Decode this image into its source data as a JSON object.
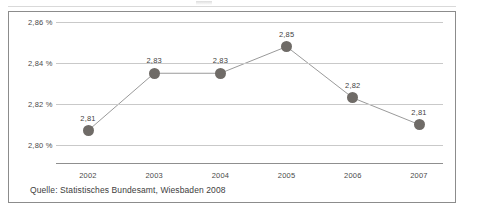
{
  "chart_data": {
    "type": "line",
    "title": "",
    "xlabel": "",
    "ylabel": "",
    "categories": [
      "2002",
      "2003",
      "2004",
      "2005",
      "2006",
      "2007"
    ],
    "values": [
      2.81,
      2.83,
      2.83,
      2.85,
      2.82,
      2.81
    ],
    "plotted_values": [
      2.807,
      2.835,
      2.835,
      2.848,
      2.823,
      2.81
    ],
    "point_labels": [
      "2,81",
      "2,83",
      "2,83",
      "2,85",
      "2,82",
      "2,81"
    ],
    "ylim": [
      2.795,
      2.862
    ],
    "yticks": [
      2.86,
      2.84,
      2.82,
      2.8
    ],
    "ytick_labels": [
      "2,86 %",
      "2,84 %",
      "2,82 %",
      "2,80 %"
    ],
    "grid": true,
    "legend": "none",
    "series": [
      {
        "name": "",
        "values": [
          2.81,
          2.83,
          2.83,
          2.85,
          2.82,
          2.81
        ]
      }
    ],
    "marker_color": "#6f6b67",
    "line_color": "#9a9a9a",
    "gridline_color": "#c9c9c9",
    "axis_color": "#8f8f8f"
  },
  "caption": {
    "source": "Quelle: Statistisches Bundesamt, Wiesbaden 2008"
  }
}
